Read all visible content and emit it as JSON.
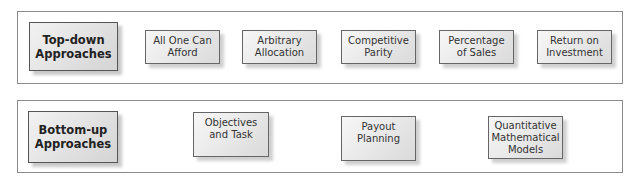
{
  "top_down": {
    "title": "Top-down\nApproaches",
    "items": [
      {
        "label": "All One Can\nAfford"
      },
      {
        "label": "Arbitrary\nAllocation"
      },
      {
        "label": "Competitive\nParity"
      },
      {
        "label": "Percentage\nof Sales"
      },
      {
        "label": "Return on\nInvestment"
      }
    ]
  },
  "bottom_up": {
    "title": "Bottom-up\nApproaches",
    "items": [
      {
        "label": "Objectives\nand Task"
      },
      {
        "label": "Payout\nPlanning"
      },
      {
        "label": "Quantitative\nMathematical\nModels"
      }
    ]
  }
}
